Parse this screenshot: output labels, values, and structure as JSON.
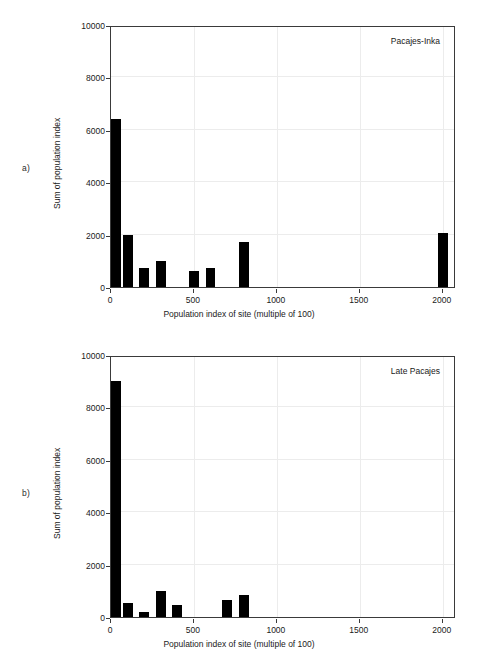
{
  "figure": {
    "background": "#ffffff",
    "bar_color": "#000000",
    "axis_color": "#3a3a3a",
    "grid_color": "#ececec"
  },
  "panels": [
    {
      "tag": "a)",
      "series_label": "Pacajes-Inka"
    },
    {
      "tag": "b)",
      "series_label": "Late Pacajes"
    }
  ],
  "axis": {
    "xlabel": "Population index of site (multiple of 100)",
    "ylabel": "Sum of population index",
    "x_ticks": [
      0,
      500,
      1000,
      1500,
      2000
    ],
    "x_tick_labels": [
      "0",
      "500",
      "1000",
      "1500",
      "2000"
    ],
    "y_ticks": [
      0,
      2000,
      4000,
      6000,
      8000,
      10000
    ],
    "y_tick_labels": [
      "0",
      "2000",
      "4000",
      "6000",
      "8000",
      "10000"
    ],
    "xlim": [
      0,
      2080
    ],
    "ylim": [
      0,
      10000
    ]
  },
  "chart_data": [
    {
      "type": "bar",
      "title": "Pacajes-Inka",
      "panel": "a)",
      "xlabel": "Population index of site (multiple of 100)",
      "ylabel": "Sum of population index",
      "xlim": [
        0,
        2080
      ],
      "ylim": [
        0,
        10000
      ],
      "grid": true,
      "legend": "none",
      "x": [
        0,
        100,
        200,
        300,
        500,
        600,
        800,
        2000
      ],
      "values": [
        6400,
        2000,
        730,
        1000,
        620,
        720,
        1700,
        2050
      ],
      "bar_width": 60,
      "x_ticks": [
        0,
        500,
        1000,
        1500,
        2000
      ],
      "y_ticks": [
        0,
        2000,
        4000,
        6000,
        8000,
        10000
      ]
    },
    {
      "type": "bar",
      "title": "Late Pacajes",
      "panel": "b)",
      "xlabel": "Population index of site (multiple of 100)",
      "ylabel": "Sum of population index",
      "xlim": [
        0,
        2080
      ],
      "ylim": [
        0,
        10000
      ],
      "grid": true,
      "legend": "none",
      "x": [
        0,
        100,
        200,
        300,
        400,
        700,
        800
      ],
      "values": [
        9000,
        520,
        180,
        1000,
        440,
        650,
        830
      ],
      "bar_width": 60,
      "x_ticks": [
        0,
        500,
        1000,
        1500,
        2000
      ],
      "y_ticks": [
        0,
        2000,
        4000,
        6000,
        8000,
        10000
      ]
    }
  ]
}
